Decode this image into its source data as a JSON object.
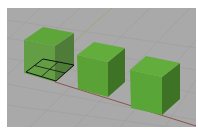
{
  "viewport": {
    "name": "perspective-viewport",
    "background": "#a9a9a9",
    "grid_color": "#9c9c9c",
    "x_axis_color": "#8a4a45",
    "y_axis_color": "#9a9a7a",
    "selected_edge_color": "#111111"
  },
  "objects": [
    {
      "name": "box-1",
      "state": "partially-selected",
      "face_top": "#5ea63a",
      "face_front": "#5a9c36",
      "face_side": "#3f7426"
    },
    {
      "name": "box-2",
      "state": "unselected",
      "face_top": "#62ad3c",
      "face_front": "#5aa236",
      "face_side": "#3e7325"
    },
    {
      "name": "box-3",
      "state": "unselected",
      "face_top": "#62ad3c",
      "face_front": "#5aa538",
      "face_side": "#3e7325"
    }
  ]
}
